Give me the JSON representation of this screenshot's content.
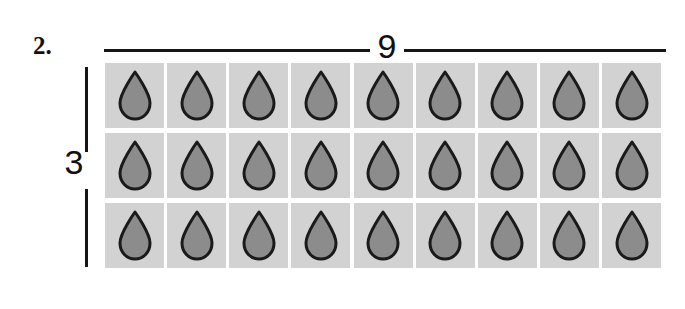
{
  "worksheet": {
    "problem_number": "2.",
    "top_bracket_label": "9",
    "left_bracket_label": "3",
    "icon_name": "water-droplet-icon"
  },
  "array": {
    "rows": 3,
    "columns": 9,
    "total": 27,
    "cell_icon": "water-droplet-icon",
    "row_labels": [
      "row-1",
      "row-2",
      "row-3"
    ]
  },
  "colors": {
    "tile_background": "#d2d2d2",
    "droplet_fill": "#8c8c8c",
    "droplet_outline": "#1a1a1a",
    "line": "#161616",
    "text": "#111111",
    "page_background": "#ffffff"
  },
  "chart_data": {
    "type": "table",
    "title": "",
    "categories": [
      "column-1",
      "column-2",
      "column-3",
      "column-4",
      "column-5",
      "column-6",
      "column-7",
      "column-8",
      "column-9"
    ],
    "series": [
      {
        "name": "row-1",
        "values": [
          1,
          1,
          1,
          1,
          1,
          1,
          1,
          1,
          1
        ]
      },
      {
        "name": "row-2",
        "values": [
          1,
          1,
          1,
          1,
          1,
          1,
          1,
          1,
          1
        ]
      },
      {
        "name": "row-3",
        "values": [
          1,
          1,
          1,
          1,
          1,
          1,
          1,
          1,
          1
        ]
      }
    ],
    "xlabel": "9",
    "ylabel": "3",
    "annotations": [
      "2.",
      "9",
      "3"
    ]
  }
}
